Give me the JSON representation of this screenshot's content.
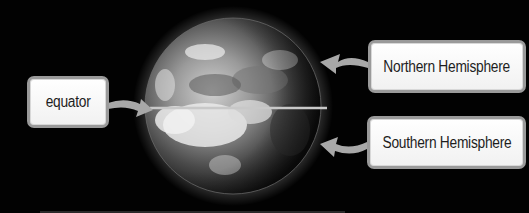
{
  "diagram": {
    "labels": {
      "equator": "equator",
      "northern": "Northern Hemisphere",
      "southern": "Southern Hemisphere"
    },
    "colors": {
      "background": "#020202",
      "label_fill": "#ffffff",
      "label_border": "#9a9a9a",
      "arrow": "#a8a8a8",
      "equator_line": "#c8c8c8",
      "text": "#1e1e1e"
    }
  }
}
